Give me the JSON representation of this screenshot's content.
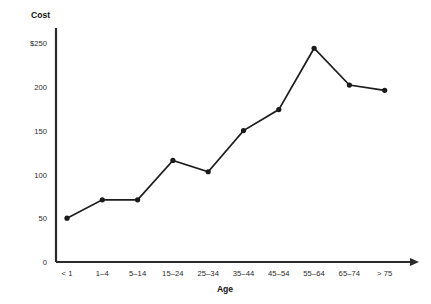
{
  "chart_data": {
    "type": "line",
    "title": "",
    "ylabel": "Cost",
    "xlabel": "Age",
    "categories": [
      "< 1",
      "1–4",
      "5–14",
      "15–24",
      "25–34",
      "35–44",
      "45–54",
      "55–64",
      "65–74",
      "> 75"
    ],
    "values": [
      50,
      71,
      71,
      116,
      103,
      150,
      174,
      244,
      202,
      196
    ],
    "series": [
      {
        "name": "Cost",
        "values": [
          50,
          71,
          71,
          116,
          103,
          150,
          174,
          244,
          202,
          196
        ]
      }
    ],
    "ylim": [
      0,
      250
    ],
    "yticks": [
      0,
      50,
      100,
      150,
      200,
      250
    ],
    "ytick_labels": [
      "0",
      "50",
      "100",
      "150",
      "200",
      "$250"
    ],
    "grid": false,
    "legend": "none",
    "marker": "filled-circle",
    "line_color": "#1d1d1d",
    "marker_color": "#1a1a1a",
    "axis_color": "#2b2b2b",
    "background": "#ffffff"
  }
}
